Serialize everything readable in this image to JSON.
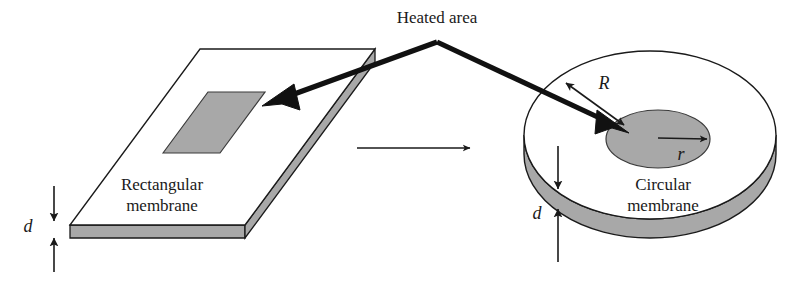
{
  "figure": {
    "title_text": "Heated area",
    "background_color": "#ffffff",
    "ink_color": "#1a1a1a",
    "shade_color": "#a8a8a8",
    "rim_color": "#a0a0a0"
  },
  "labels": {
    "heated_area": "Heated area",
    "rectangular_line1": "Rectangular",
    "rectangular_line2": "membrane",
    "circular_line1": "Circular",
    "circular_line2": "membrane",
    "thickness_left": "d",
    "thickness_right": "d",
    "outer_radius": "R",
    "inner_radius": "r"
  },
  "left_object": {
    "name": "rectangular-membrane",
    "kind": "slab",
    "top_face_points": "70,225 200,49 375,49 245,225",
    "thickness_px": 13,
    "heated_patch_points": "163,153 208,92 265,92 220,153",
    "heated_patch_fill": "#a8a8a8"
  },
  "right_object": {
    "name": "circular-membrane",
    "kind": "disk",
    "outer_ellipse": {
      "cx": 650,
      "cy": 135,
      "rx": 126,
      "ry": 84
    },
    "rim_depth_px": 19,
    "heated_patch_ellipse": {
      "cx": 658,
      "cy": 139,
      "rx": 52,
      "ry": 29
    },
    "heated_patch_fill": "#a8a8a8"
  },
  "connectors": {
    "apex": {
      "x": 437,
      "y": 42
    },
    "left_arrow_tip": {
      "x": 264,
      "y": 104
    },
    "right_arrow_tip": {
      "x": 627,
      "y": 134
    },
    "transform_arrow": {
      "x1": 357,
      "y1": 148,
      "x2": 472,
      "y2": 148
    }
  },
  "dimension_markers": {
    "left": {
      "x": 54,
      "down_arrow_from_y": 186,
      "down_arrow_to_y": 223,
      "up_arrow_from_y": 272,
      "up_arrow_to_y": 236,
      "label_x": 28,
      "label_y": 230
    },
    "right": {
      "x": 558,
      "down_arrow_from_y": 146,
      "down_arrow_to_y": 191,
      "up_arrow_from_y": 258,
      "up_arrow_to_y": 207,
      "label_x": 537,
      "label_y": 217
    },
    "R_label": {
      "x": 604,
      "y": 83
    },
    "r_label": {
      "x": 681,
      "y": 155
    }
  }
}
